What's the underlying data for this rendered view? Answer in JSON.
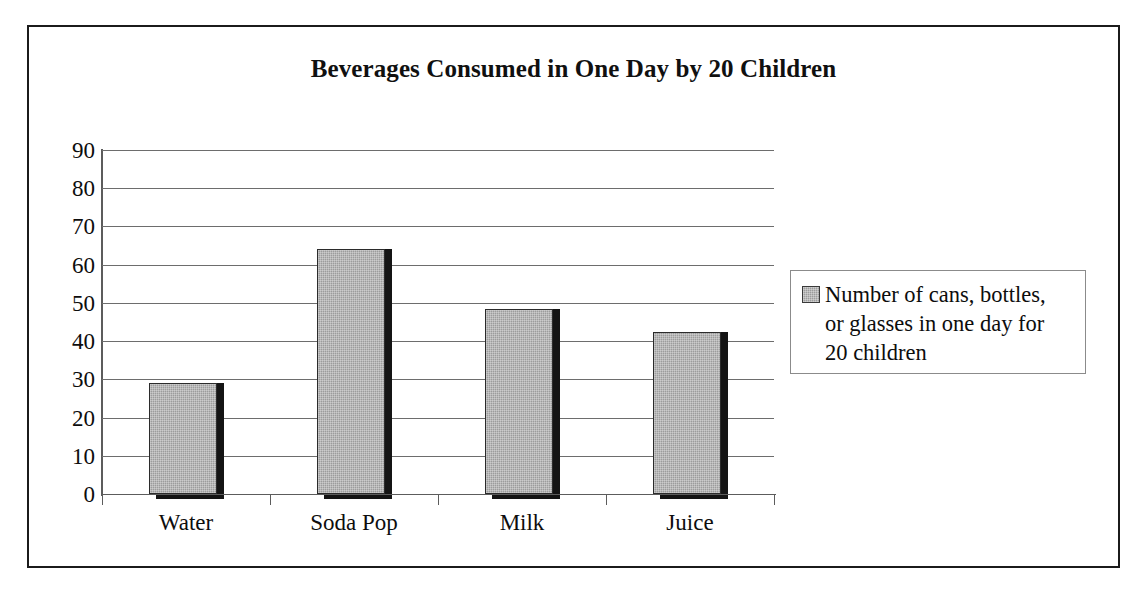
{
  "chart_data": {
    "type": "bar",
    "title": "Beverages Consumed in One Day by 20 Children",
    "categories": [
      "Water",
      "Soda Pop",
      "Milk",
      "Juice"
    ],
    "values": [
      29,
      64,
      48.5,
      42.5
    ],
    "series": [
      {
        "name": "Number of cans, bottles, or glasses in one day for 20 children",
        "values": [
          29,
          64,
          48.5,
          42.5
        ]
      }
    ],
    "xlabel": "",
    "ylabel": "",
    "ylim": [
      0,
      90
    ],
    "ytick_step": 10,
    "yticks": [
      "90",
      "80",
      "70",
      "60",
      "50",
      "40",
      "30",
      "20",
      "10",
      "0"
    ],
    "grid": true,
    "grid_axis": "y",
    "legend_position": "right",
    "legend_entries": [
      {
        "label_lines": [
          "Number of cans, bottles,",
          "or glasses in one day for",
          "20 children"
        ],
        "swatch_color": "#9c9c9c"
      }
    ],
    "bar_color": "#9c9c9c",
    "bar_edge_color": "#2b2b2b",
    "bar_shadow_color": "#141414",
    "background_color": "#ffffff",
    "frame_color": "#1b1b1b",
    "gridline_color": "#6d6d6d",
    "axis_color": "#5c5c5c",
    "text_color": "#0d0d0d"
  },
  "legend": {
    "line1": "Number of cans, bottles,",
    "line2": "or glasses in one day for",
    "line3": "20 children"
  }
}
